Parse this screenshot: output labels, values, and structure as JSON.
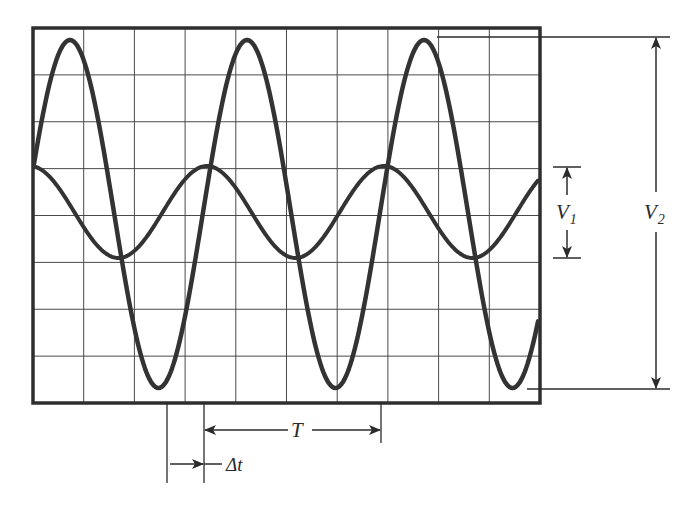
{
  "diagram": {
    "colors": {
      "background": "#ffffff",
      "grid": "#4a4a4a",
      "frame": "#2e2e2e",
      "trace": "#333333",
      "annotation": "#2b2b2b"
    },
    "screen": {
      "x": 33,
      "y": 28,
      "width": 507,
      "height": 375,
      "h_divisions": 10,
      "v_divisions": 8
    },
    "traces": [
      {
        "name": "large-signal",
        "amplitude_px": 174,
        "center_y": 214,
        "period_px": 177,
        "phase_peak_x": 70
      },
      {
        "name": "small-signal",
        "amplitude_px": 46,
        "center_y": 212,
        "period_px": 177,
        "phase_peak_x": 30
      }
    ],
    "labels": {
      "v1_main": "V",
      "v1_sub": "1",
      "v2_main": "V",
      "v2_sub": "2",
      "period": "T",
      "delta_prefix": "Δ",
      "delta_var": "t"
    },
    "annotations": {
      "v1": {
        "top_y": 167,
        "bottom_y": 258,
        "x": 567,
        "bar_x1": 553,
        "bar_x2": 581
      },
      "v2": {
        "top_y": 37,
        "bottom_y": 389,
        "x": 656,
        "top_line_x1": 437,
        "bottom_line_x1": 527,
        "line_x2": 670
      },
      "period": {
        "x1": 204,
        "x2": 381,
        "y": 430
      },
      "delta_t": {
        "x1": 167,
        "x2": 204,
        "y": 464
      }
    }
  }
}
